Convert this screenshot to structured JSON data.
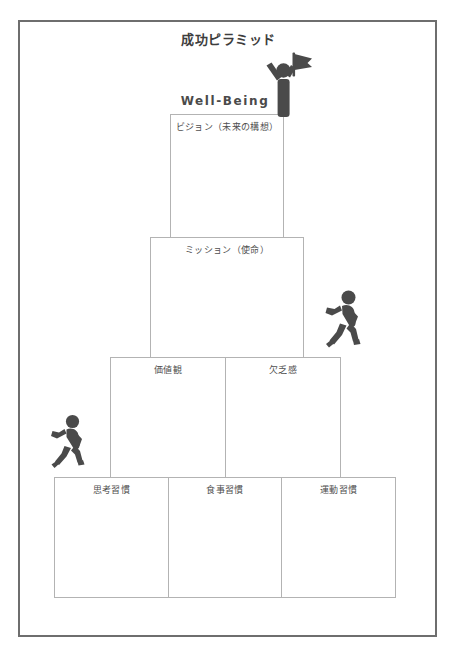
{
  "document": {
    "title": "成功ピラミッド",
    "frame_color": "#6e6e6e",
    "background": "#ffffff"
  },
  "labels": {
    "wellbeing": "Well-Being"
  },
  "colors": {
    "box_border": "#b3b3b3",
    "text": "#4f4f4f",
    "title_text": "#3d3d3d",
    "figure_fill": "#4a4a4a"
  },
  "pyramid": {
    "tiers": [
      {
        "name": "vision",
        "cells": [
          {
            "label": "ビジョン（未来の構想）"
          }
        ]
      },
      {
        "name": "mission",
        "cells": [
          {
            "label": "ミッション（使命）"
          }
        ]
      },
      {
        "name": "values",
        "cells": [
          {
            "label": "価値観"
          },
          {
            "label": "欠乏感"
          }
        ]
      },
      {
        "name": "habits",
        "cells": [
          {
            "label": "思考習慣"
          },
          {
            "label": "食事習慣"
          },
          {
            "label": "運動習慣"
          }
        ]
      }
    ]
  },
  "figures": [
    {
      "name": "person-with-flag",
      "position": "top"
    },
    {
      "name": "running-person",
      "position": "right"
    },
    {
      "name": "running-person",
      "position": "left"
    }
  ]
}
